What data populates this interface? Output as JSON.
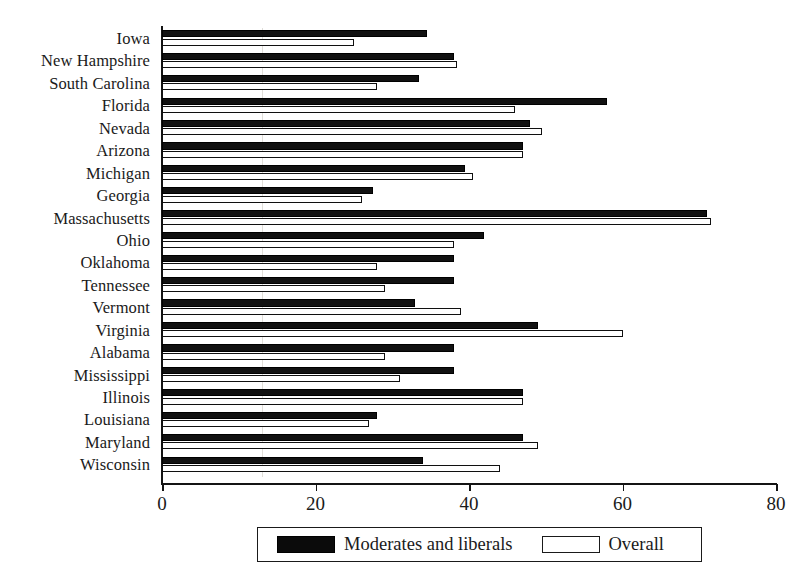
{
  "chart_data": {
    "type": "bar",
    "orientation": "horizontal",
    "title": "",
    "subtitle": "",
    "xlabel": "",
    "ylabel": "",
    "xlim": [
      0,
      80
    ],
    "xticks": [
      0,
      20,
      40,
      60,
      80
    ],
    "xtick_labels": [
      "0",
      "20",
      "40",
      "60",
      "80"
    ],
    "grid": false,
    "legend_position": "bottom",
    "categories": [
      "Iowa",
      "New Hampshire",
      "South Carolina",
      "Florida",
      "Nevada",
      "Arizona",
      "Michigan",
      "Georgia",
      "Massachusetts",
      "Ohio",
      "Oklahoma",
      "Tennessee",
      "Vermont",
      "Virginia",
      "Alabama",
      "Mississippi",
      "Illinois",
      "Louisiana",
      "Maryland",
      "Wisconsin"
    ],
    "series": [
      {
        "name": "Moderates and liberals",
        "color": "#111111",
        "values": [
          34.5,
          38,
          33.5,
          58,
          48,
          47,
          39.5,
          27.5,
          71,
          42,
          38,
          38,
          33,
          49,
          38,
          38,
          47,
          28,
          47,
          34
        ]
      },
      {
        "name": "Overall",
        "color": "#ffffff",
        "values": [
          25,
          38.5,
          28,
          46,
          49.5,
          47,
          40.5,
          26,
          71.5,
          38,
          28,
          29,
          39,
          60,
          29,
          31,
          47,
          27,
          49,
          44
        ]
      }
    ]
  },
  "legend": {
    "entries": [
      {
        "label": "Moderates and liberals",
        "swatch": "black-swatch"
      },
      {
        "label": "Overall",
        "swatch": "white-swatch"
      }
    ]
  }
}
